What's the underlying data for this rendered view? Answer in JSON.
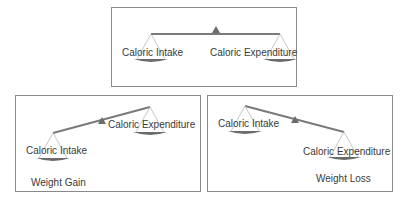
{
  "colors": {
    "border": "#8a8a8a",
    "beam": "#7a7a7a",
    "pan": "#6b6b6b",
    "string": "#b0b0b0",
    "text": "#3a3a3a"
  },
  "panels": [
    {
      "id": "balanced",
      "box": {
        "x": 111,
        "y": 7,
        "w": 186,
        "h": 80
      },
      "beam": {
        "x1": 39,
        "y1": 26,
        "x2": 168,
        "y2": 26,
        "pivot_x": 104,
        "pivot_y": 21
      },
      "left_label": "Caloric Intake",
      "right_label": "Caloric Expenditure",
      "left_label_pos": {
        "x": 10,
        "y": 40
      },
      "right_label_pos": {
        "x": 98,
        "y": 40
      },
      "result": ""
    },
    {
      "id": "weight-gain",
      "box": {
        "x": 15,
        "y": 95,
        "w": 186,
        "h": 97
      },
      "beam": {
        "x1": 37,
        "y1": 37,
        "x2": 134,
        "y2": 11,
        "pivot_x": 86,
        "pivot_y": 24
      },
      "left_label": "Caloric Intake",
      "right_label": "Caloric Expenditure",
      "left_label_pos": {
        "x": 10,
        "y": 50
      },
      "right_label_pos": {
        "x": 92,
        "y": 24
      },
      "result": "Weight Gain",
      "result_pos": {
        "x": 15,
        "y": 82
      }
    },
    {
      "id": "weight-loss",
      "box": {
        "x": 207,
        "y": 95,
        "w": 186,
        "h": 97
      },
      "beam": {
        "x1": 37,
        "y1": 10,
        "x2": 136,
        "y2": 36,
        "pivot_x": 87,
        "pivot_y": 23
      },
      "left_label": "Caloric Intake",
      "right_label": "Caloric Expenditure",
      "left_label_pos": {
        "x": 10,
        "y": 23
      },
      "right_label_pos": {
        "x": 95,
        "y": 51
      },
      "result": "Weight Loss",
      "result_pos": {
        "x": 108,
        "y": 78
      }
    }
  ]
}
